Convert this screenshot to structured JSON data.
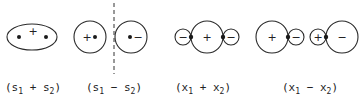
{
  "diagram": {
    "panels": [
      {
        "id": "s1_plus_s2",
        "label": {
          "open": "(s",
          "sub1": "1",
          "op": " + s",
          "sub2": "2",
          "close": ")"
        },
        "shape": "ellipse",
        "signs": [
          "+"
        ]
      },
      {
        "id": "s1_minus_s2",
        "label": {
          "open": "(s",
          "sub1": "1",
          "op": " − s",
          "sub2": "2",
          "close": ")"
        },
        "shape": "two circles with dashed nodal plane",
        "signs": [
          "+",
          "−"
        ]
      },
      {
        "id": "x1_plus_x2",
        "label": {
          "open": "(x",
          "sub1": "1",
          "op": " + x",
          "sub2": "2",
          "close": ")"
        },
        "shape": "small-big-small lobes",
        "signs": [
          "−",
          "+",
          "−"
        ]
      },
      {
        "id": "x1_minus_x2",
        "label": {
          "open": "(x",
          "sub1": "1",
          "op": " − x",
          "sub2": "2",
          "close": ")"
        },
        "shape": "big-small, small-big lobes",
        "signs": [
          "+",
          "−",
          "+",
          "−"
        ]
      }
    ]
  }
}
